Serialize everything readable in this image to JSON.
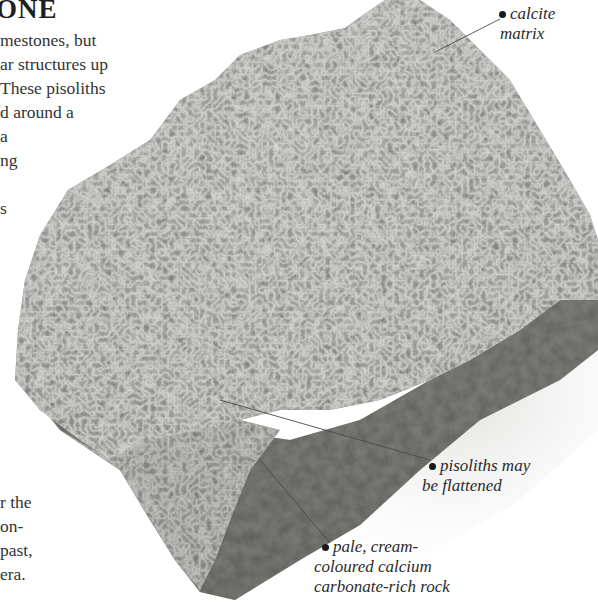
{
  "page": {
    "title": "ONE",
    "intro_lines": [
      "mestones, but",
      "ar structures up",
      "These pisoliths",
      "d around a",
      "a",
      "ng",
      "",
      "s"
    ],
    "outro_lines": [
      "r the",
      "on-",
      "past,",
      "era."
    ]
  },
  "figure": {
    "colors": {
      "rock_light": "#d9d9d6",
      "rock_mid": "#a9a9a5",
      "rock_dark": "#6f6f6b",
      "shadow": "#e9e9e7",
      "leader_line": "#4a4a4a",
      "dot": "#1a1a1a"
    },
    "annotations": [
      {
        "id": "calcite-matrix",
        "lines": [
          "calcite",
          "matrix"
        ]
      },
      {
        "id": "pisoliths-flattened",
        "lines": [
          "pisoliths may",
          "be flattened"
        ]
      },
      {
        "id": "pale-rock",
        "lines": [
          "pale, cream-",
          "coloured calcium",
          "carbonate-rich rock"
        ]
      }
    ]
  }
}
